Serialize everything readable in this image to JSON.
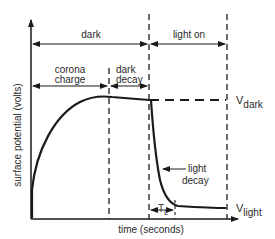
{
  "diagram": {
    "phases": {
      "dark": "dark",
      "light_on": "light on",
      "corona_line1": "corona",
      "corona_line2": "charge",
      "dark_decay_line1": "dark",
      "dark_decay_line2": "decay"
    },
    "axes": {
      "ylabel": "surface potential (volts)",
      "xlabel": "time (seconds)"
    },
    "annotations": {
      "v_dark_main": "V",
      "v_dark_sub": "dark",
      "v_light_main": "V",
      "v_light_sub": "light",
      "light_decay_line1": "light",
      "light_decay_line2": "decay",
      "tl_main": "T",
      "tl_sub": "L"
    },
    "colors": {
      "ink": "#1a1a1a"
    }
  }
}
